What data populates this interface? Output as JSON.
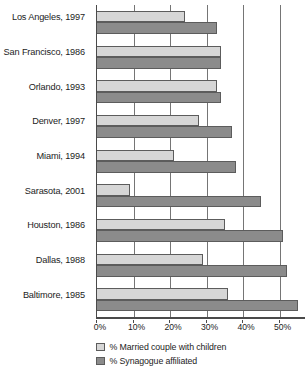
{
  "chart_data": {
    "type": "bar",
    "orientation": "horizontal",
    "title": "",
    "subtitle": "",
    "xlabel": "",
    "ylabel": "",
    "xlim": [
      0,
      57
    ],
    "grid": true,
    "gridlines_vertical": true,
    "legend_position": "bottom",
    "axis_tick_labels": [
      "0%",
      "10%",
      "20%",
      "30%",
      "40%",
      "50%"
    ],
    "axis_tick_values": [
      0,
      10,
      20,
      30,
      40,
      50
    ],
    "categories": [
      "Los Angeles, 1997",
      "San Francisco, 1986",
      "Orlando, 1993",
      "Denver, 1997",
      "Miami, 1994",
      "Sarasota, 2001",
      "Houston, 1986",
      "Dallas, 1988",
      "Baltimore, 1985"
    ],
    "series": [
      {
        "name": "% Married couple with children",
        "color": "#d6d6d6",
        "values": [
          24,
          34,
          33,
          28,
          21,
          9,
          35,
          29,
          36
        ]
      },
      {
        "name": "% Synagogue affiliated",
        "color": "#8b8b8b",
        "values": [
          33,
          34,
          34,
          37,
          38,
          45,
          51,
          52,
          55
        ]
      }
    ]
  },
  "legend": {
    "items": [
      {
        "label": "% Married couple with children",
        "swatch": "light"
      },
      {
        "label": "% Synagogue affiliated",
        "swatch": "dark"
      }
    ]
  }
}
